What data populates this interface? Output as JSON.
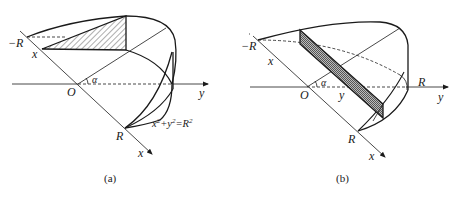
{
  "figures": [
    {
      "id": "a",
      "caption": "(a)",
      "labels": {
        "neg_r": "−R",
        "x_point": "x",
        "origin": "O",
        "alpha": "α",
        "y_axis": "y",
        "r_point": "R",
        "x_axis": "x",
        "equation_base": "x",
        "equation_sup1": "2",
        "equation_plus": "+y",
        "equation_sup2": "2",
        "equation_eq": "=R",
        "equation_sup3": "2"
      },
      "description": "Wedge solid cut from a cylinder of radius R; triangular cross-section perpendicular to x-axis at x, hatched"
    },
    {
      "id": "b",
      "caption": "(b)",
      "labels": {
        "neg_r": "−R",
        "x_dim": "x",
        "origin": "O",
        "alpha": "α",
        "y_point": "y",
        "r_right": "R",
        "y_axis": "y",
        "r_point": "R",
        "x_axis": "x"
      },
      "description": "Same wedge; rectangular cross-section perpendicular to y-axis at y, cross-hatched"
    }
  ],
  "colors": {
    "stroke": "#1a1a1a",
    "hatch": "#333333",
    "background": "#ffffff"
  }
}
